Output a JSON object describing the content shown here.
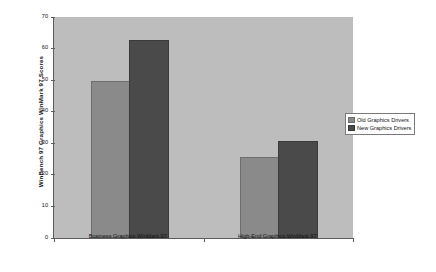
{
  "chart_data": {
    "type": "bar",
    "title": "",
    "xlabel": "",
    "ylabel": "WinBench 97 Graphics WinMark 97 Scores",
    "ylim": [
      0,
      70
    ],
    "yticks": [
      70,
      60,
      50,
      40,
      30,
      20,
      10,
      0
    ],
    "grid": false,
    "legend_position": "right",
    "categories": [
      "Business Graphics WinMark 97",
      "High-End Graphics WinMark 97"
    ],
    "series": [
      {
        "name": "Old Graphics Drivers",
        "color": "#8a8a8a",
        "values": [
          49,
          25
        ]
      },
      {
        "name": "New Graphics Drivers",
        "color": "#4a4a4a",
        "values": [
          62,
          30
        ]
      }
    ]
  },
  "colors": {
    "plot_background": "#bdbdbd",
    "page_background": "#ffffff",
    "axis": "#5c5c5c",
    "text": "#111111"
  }
}
